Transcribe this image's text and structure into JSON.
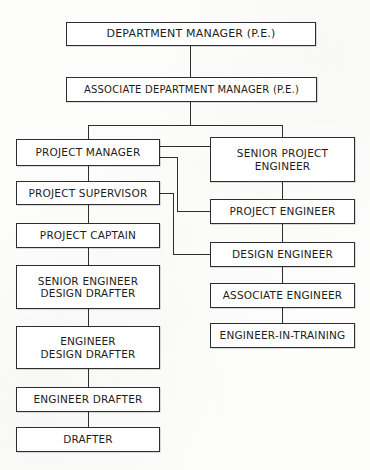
{
  "chart": {
    "type": "organization-chart",
    "orientation": "top-down",
    "colors": {
      "line": "#2e2e2e",
      "box_fill": "#ffffff",
      "text": "#1d1d1d",
      "background": "#fdfdfc"
    },
    "nodes": [
      {
        "id": "department-manager",
        "lines": [
          "DEPARTMENT MANAGER (P.E.)"
        ],
        "x": 66,
        "y": 22,
        "w": 250,
        "h": 24,
        "font_size": 11,
        "column": "center",
        "level": 0
      },
      {
        "id": "associate-department-manager",
        "lines": [
          "ASSOCIATE DEPARTMENT MANAGER (P.E.)"
        ],
        "x": 66,
        "y": 77,
        "w": 251,
        "h": 25,
        "font_size": 10,
        "column": "center",
        "level": 1
      },
      {
        "id": "project-manager",
        "lines": [
          "PROJECT MANAGER"
        ],
        "x": 16,
        "y": 139,
        "w": 144,
        "h": 27,
        "font_size": 10.5,
        "column": "left",
        "level": 2
      },
      {
        "id": "senior-project-engineer",
        "lines": [
          "SENIOR PROJECT",
          "ENGINEER"
        ],
        "x": 210,
        "y": 137,
        "w": 145,
        "h": 45,
        "font_size": 10.5,
        "column": "right",
        "level": 2
      },
      {
        "id": "project-supervisor",
        "lines": [
          "PROJECT SUPERVISOR"
        ],
        "x": 16,
        "y": 181,
        "w": 144,
        "h": 24,
        "font_size": 10.5,
        "column": "left",
        "level": 3
      },
      {
        "id": "project-engineer",
        "lines": [
          "PROJECT ENGINEER"
        ],
        "x": 210,
        "y": 199,
        "w": 145,
        "h": 25,
        "font_size": 10.5,
        "column": "right",
        "level": 3
      },
      {
        "id": "project-captain",
        "lines": [
          "PROJECT CAPTAIN"
        ],
        "x": 16,
        "y": 223,
        "w": 144,
        "h": 25,
        "font_size": 10.5,
        "column": "left",
        "level": 4
      },
      {
        "id": "design-engineer",
        "lines": [
          "DESIGN ENGINEER"
        ],
        "x": 210,
        "y": 242,
        "w": 145,
        "h": 25,
        "font_size": 10.5,
        "column": "right",
        "level": 4
      },
      {
        "id": "senior-engineer-design-drafter",
        "lines": [
          "SENIOR ENGINEER",
          "DESIGN DRAFTER"
        ],
        "x": 16,
        "y": 265,
        "w": 144,
        "h": 44,
        "font_size": 10.5,
        "column": "left",
        "level": 5
      },
      {
        "id": "associate-engineer",
        "lines": [
          "ASSOCIATE ENGINEER"
        ],
        "x": 210,
        "y": 283,
        "w": 145,
        "h": 25,
        "font_size": 10.5,
        "column": "right",
        "level": 5
      },
      {
        "id": "engineer-design-drafter",
        "lines": [
          "ENGINEER",
          "DESIGN DRAFTER"
        ],
        "x": 16,
        "y": 326,
        "w": 144,
        "h": 43,
        "font_size": 10.5,
        "column": "left",
        "level": 6
      },
      {
        "id": "engineer-in-training",
        "lines": [
          "ENGINEER-IN-TRAINING"
        ],
        "x": 210,
        "y": 323,
        "w": 145,
        "h": 25,
        "font_size": 10.5,
        "column": "right",
        "level": 6
      },
      {
        "id": "engineer-drafter",
        "lines": [
          "ENGINEER DRAFTER"
        ],
        "x": 16,
        "y": 387,
        "w": 144,
        "h": 25,
        "font_size": 10.5,
        "column": "left",
        "level": 7
      },
      {
        "id": "drafter",
        "lines": [
          "DRAFTER"
        ],
        "x": 16,
        "y": 427,
        "w": 144,
        "h": 25,
        "font_size": 10.5,
        "column": "left",
        "level": 8
      }
    ],
    "connectors": [
      {
        "id": "dm-to-adm",
        "from": "department-manager",
        "to": "associate-department-manager",
        "orient": "v",
        "x": 190,
        "y": 46,
        "len": 31
      },
      {
        "id": "adm-down-stub",
        "from": "associate-department-manager",
        "to": "bus",
        "orient": "v",
        "x": 190,
        "y": 102,
        "len": 24
      },
      {
        "id": "level2-bus",
        "from": "bus",
        "to": "bus",
        "orient": "h",
        "x": 88,
        "y": 125,
        "len": 195
      },
      {
        "id": "bus-to-project-manager",
        "from": "bus",
        "to": "project-manager",
        "orient": "v",
        "x": 88,
        "y": 125,
        "len": 14
      },
      {
        "id": "bus-to-senior-project-engineer",
        "from": "bus",
        "to": "senior-project-engineer",
        "orient": "v",
        "x": 282,
        "y": 125,
        "len": 12
      },
      {
        "id": "pm-to-spe",
        "from": "project-manager",
        "to": "senior-project-engineer",
        "orient": "h",
        "x": 160,
        "y": 146,
        "len": 50
      },
      {
        "id": "pm-to-pe-h1",
        "from": "project-manager",
        "to": "project-engineer",
        "orient": "h",
        "x": 160,
        "y": 157,
        "len": 18
      },
      {
        "id": "pm-to-pe-v",
        "from": "project-manager",
        "to": "project-engineer",
        "orient": "v",
        "x": 177,
        "y": 157,
        "len": 55
      },
      {
        "id": "pm-to-pe-h2",
        "from": "project-manager",
        "to": "project-engineer",
        "orient": "h",
        "x": 177,
        "y": 211,
        "len": 33
      },
      {
        "id": "pm-to-ps",
        "from": "project-manager",
        "to": "project-supervisor",
        "orient": "v",
        "x": 88,
        "y": 166,
        "len": 16
      },
      {
        "id": "ps-to-de-h1",
        "from": "project-supervisor",
        "to": "design-engineer",
        "orient": "h",
        "x": 160,
        "y": 193,
        "len": 14
      },
      {
        "id": "ps-to-de-v",
        "from": "project-supervisor",
        "to": "design-engineer",
        "orient": "v",
        "x": 173,
        "y": 193,
        "len": 62
      },
      {
        "id": "ps-to-de-h2",
        "from": "project-supervisor",
        "to": "design-engineer",
        "orient": "h",
        "x": 173,
        "y": 254,
        "len": 37
      },
      {
        "id": "ps-to-pc",
        "from": "project-supervisor",
        "to": "project-captain",
        "orient": "v",
        "x": 88,
        "y": 205,
        "len": 19
      },
      {
        "id": "pc-to-sedd",
        "from": "project-captain",
        "to": "senior-engineer-design-drafter",
        "orient": "v",
        "x": 88,
        "y": 248,
        "len": 18
      },
      {
        "id": "sedd-to-edd",
        "from": "senior-engineer-design-drafter",
        "to": "engineer-design-drafter",
        "orient": "v",
        "x": 88,
        "y": 309,
        "len": 18
      },
      {
        "id": "edd-to-ed",
        "from": "engineer-design-drafter",
        "to": "engineer-drafter",
        "orient": "v",
        "x": 88,
        "y": 369,
        "len": 19
      },
      {
        "id": "ed-to-drafter",
        "from": "engineer-drafter",
        "to": "drafter",
        "orient": "v",
        "x": 88,
        "y": 412,
        "len": 16
      },
      {
        "id": "spe-to-pe",
        "from": "senior-project-engineer",
        "to": "project-engineer",
        "orient": "v",
        "x": 282,
        "y": 182,
        "len": 18
      },
      {
        "id": "pe-to-de",
        "from": "project-engineer",
        "to": "design-engineer",
        "orient": "v",
        "x": 282,
        "y": 224,
        "len": 19
      },
      {
        "id": "de-to-ae",
        "from": "design-engineer",
        "to": "associate-engineer",
        "orient": "v",
        "x": 282,
        "y": 267,
        "len": 17
      },
      {
        "id": "ae-to-eit",
        "from": "associate-engineer",
        "to": "engineer-in-training",
        "orient": "v",
        "x": 282,
        "y": 308,
        "len": 16
      }
    ]
  }
}
